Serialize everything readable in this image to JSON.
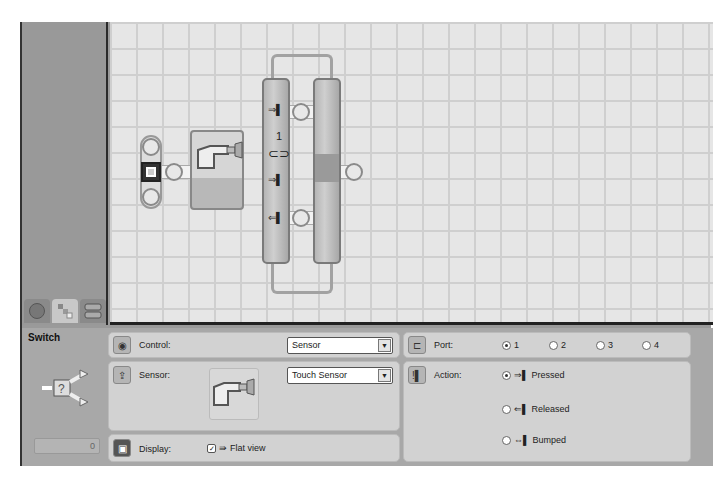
{
  "palette": {
    "tabs": [
      {
        "name": "common-palette",
        "icon": "circle-icon",
        "active": false
      },
      {
        "name": "complete-palette",
        "icon": "blocks-icon",
        "active": true
      },
      {
        "name": "custom-palette",
        "icon": "stack-icon",
        "active": false
      }
    ]
  },
  "canvas": {
    "switch_block": {
      "port_label": "1",
      "upper_branch_icon": "pressed-icon",
      "lower_branch_icon": "released-icon",
      "sensor": "touch-sensor"
    }
  },
  "properties": {
    "block_title": "Switch",
    "block_number": "0",
    "control": {
      "label": "Control:",
      "value": "Sensor"
    },
    "sensor": {
      "label": "Sensor:",
      "value": "Touch Sensor"
    },
    "display": {
      "label": "Display:",
      "option_label": "Flat view",
      "checked": true
    },
    "port": {
      "label": "Port:",
      "options": [
        {
          "label": "1",
          "selected": true
        },
        {
          "label": "2",
          "selected": false
        },
        {
          "label": "3",
          "selected": false
        },
        {
          "label": "4",
          "selected": false
        }
      ]
    },
    "action": {
      "label": "Action:",
      "options": [
        {
          "label": "Pressed",
          "selected": true
        },
        {
          "label": "Released",
          "selected": false
        },
        {
          "label": "Bumped",
          "selected": false
        }
      ]
    }
  }
}
